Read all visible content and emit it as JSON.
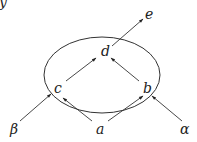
{
  "diagram": {
    "corner_glyph": "y",
    "region": {
      "shape": "ellipse",
      "cx": 102,
      "cy": 75,
      "rx": 58,
      "ry": 38
    },
    "nodes": {
      "d": {
        "label": "d",
        "x": 106,
        "y": 55
      },
      "e": {
        "label": "e",
        "x": 148,
        "y": 20
      },
      "c": {
        "label": "c",
        "x": 58,
        "y": 92
      },
      "b": {
        "label": "b",
        "x": 147,
        "y": 92
      },
      "a": {
        "label": "a",
        "x": 101,
        "y": 133
      },
      "beta": {
        "label": "β",
        "x": 14,
        "y": 133
      },
      "alpha": {
        "label": "α",
        "x": 184,
        "y": 133
      }
    },
    "edges": [
      {
        "from": "d",
        "to": "e"
      },
      {
        "from": "c",
        "to": "d"
      },
      {
        "from": "b",
        "to": "d"
      },
      {
        "from": "a",
        "to": "c"
      },
      {
        "from": "a",
        "to": "b"
      },
      {
        "from": "beta",
        "to": "c"
      },
      {
        "from": "alpha",
        "to": "b"
      }
    ],
    "colors": {
      "stroke": "#333333",
      "text": "#222222",
      "background": "#ffffff"
    }
  }
}
